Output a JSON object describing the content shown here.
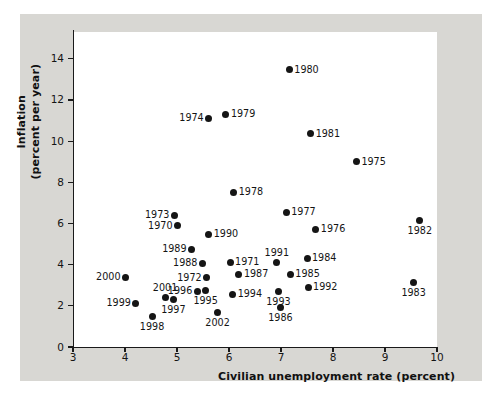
{
  "chart_data": {
    "type": "scatter",
    "title": "",
    "xlabel": "Civilian unemployment rate (percent)",
    "ylabel_line1": "Inflation",
    "ylabel_line2": "(percent per year)",
    "xlim": [
      3,
      10
    ],
    "ylim": [
      0,
      15.3
    ],
    "xticks": [
      3,
      4,
      5,
      6,
      7,
      8,
      9,
      10
    ],
    "yticks": [
      0,
      2,
      4,
      6,
      8,
      10,
      12,
      14
    ],
    "grid": false,
    "legend": "none",
    "point_color": "#151515",
    "plot_background": "#ffffff",
    "frame_background": "#d8d7d3",
    "points": [
      {
        "label": "1980",
        "x": 7.16,
        "y": 13.47,
        "pos": "right"
      },
      {
        "label": "1979",
        "x": 5.94,
        "y": 11.3,
        "pos": "right"
      },
      {
        "label": "1974",
        "x": 5.61,
        "y": 11.1,
        "pos": "left"
      },
      {
        "label": "1981",
        "x": 7.57,
        "y": 10.37,
        "pos": "right"
      },
      {
        "label": "1975",
        "x": 8.45,
        "y": 9.01,
        "pos": "right"
      },
      {
        "label": "1978",
        "x": 6.09,
        "y": 7.51,
        "pos": "right"
      },
      {
        "label": "1977",
        "x": 7.1,
        "y": 6.54,
        "pos": "right"
      },
      {
        "label": "1973",
        "x": 4.95,
        "y": 6.4,
        "pos": "left"
      },
      {
        "label": "1982",
        "x": 9.67,
        "y": 6.15,
        "pos": "below"
      },
      {
        "label": "1970",
        "x": 5.01,
        "y": 5.9,
        "pos": "left"
      },
      {
        "label": "1976",
        "x": 7.67,
        "y": 5.72,
        "pos": "right"
      },
      {
        "label": "1990",
        "x": 5.61,
        "y": 5.48,
        "pos": "right"
      },
      {
        "label": "1989",
        "x": 5.28,
        "y": 4.75,
        "pos": "left"
      },
      {
        "label": "1984",
        "x": 7.5,
        "y": 4.31,
        "pos": "right"
      },
      {
        "label": "1971",
        "x": 6.02,
        "y": 4.12,
        "pos": "right"
      },
      {
        "label": "1991",
        "x": 6.92,
        "y": 4.12,
        "pos": "above"
      },
      {
        "label": "1988",
        "x": 5.49,
        "y": 4.07,
        "pos": "left"
      },
      {
        "label": "1987",
        "x": 6.19,
        "y": 3.54,
        "pos": "right"
      },
      {
        "label": "1985",
        "x": 7.18,
        "y": 3.54,
        "pos": "right"
      },
      {
        "label": "2000",
        "x": 4.01,
        "y": 3.39,
        "pos": "left"
      },
      {
        "label": "1972",
        "x": 5.57,
        "y": 3.36,
        "pos": "left"
      },
      {
        "label": "1983",
        "x": 9.55,
        "y": 3.15,
        "pos": "below"
      },
      {
        "label": "1992",
        "x": 7.52,
        "y": 2.91,
        "pos": "right"
      },
      {
        "label": "1995",
        "x": 5.55,
        "y": 2.76,
        "pos": "below"
      },
      {
        "label": "1993",
        "x": 6.95,
        "y": 2.72,
        "pos": "below"
      },
      {
        "label": "1996",
        "x": 5.39,
        "y": 2.72,
        "pos": "left"
      },
      {
        "label": "1994",
        "x": 6.07,
        "y": 2.57,
        "pos": "right"
      },
      {
        "label": "2001",
        "x": 4.77,
        "y": 2.42,
        "pos": "above"
      },
      {
        "label": "1997",
        "x": 4.93,
        "y": 2.33,
        "pos": "below"
      },
      {
        "label": "1999",
        "x": 4.21,
        "y": 2.13,
        "pos": "left"
      },
      {
        "label": "1986",
        "x": 6.99,
        "y": 1.94,
        "pos": "below"
      },
      {
        "label": "2002",
        "x": 5.78,
        "y": 1.7,
        "pos": "below"
      },
      {
        "label": "1998",
        "x": 4.52,
        "y": 1.5,
        "pos": "below"
      }
    ]
  }
}
